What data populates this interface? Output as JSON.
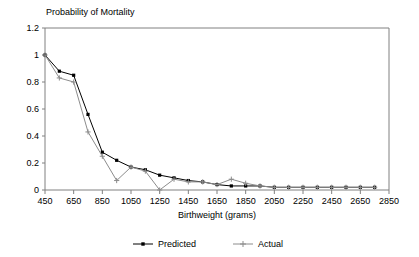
{
  "chart_data": {
    "type": "line",
    "title": "Probability of Mortality",
    "xlabel": "Birthweight (grams)",
    "ylabel": "",
    "xlim": [
      450,
      2850
    ],
    "ylim": [
      0,
      1.2
    ],
    "grid": false,
    "legend_position": "bottom",
    "x_ticks": [
      "450",
      "650",
      "850",
      "1050",
      "1250",
      "1450",
      "1650",
      "1850",
      "2050",
      "2250",
      "2450",
      "2650",
      "2850"
    ],
    "x_tick_values": [
      450,
      650,
      850,
      1050,
      1250,
      1450,
      1650,
      1850,
      2050,
      2250,
      2450,
      2650,
      2850
    ],
    "y_ticks": [
      "0",
      "0.2",
      "0.4",
      "0.6",
      "0.8",
      "1",
      "1.2"
    ],
    "y_tick_values": [
      0,
      0.2,
      0.4,
      0.6,
      0.8,
      1,
      1.2
    ],
    "x": [
      450,
      550,
      650,
      750,
      850,
      950,
      1050,
      1150,
      1250,
      1350,
      1450,
      1550,
      1650,
      1750,
      1850,
      1950,
      2050,
      2150,
      2250,
      2350,
      2450,
      2550,
      2650,
      2750
    ],
    "series": [
      {
        "name": "Predicted",
        "color": "#000000",
        "marker": "square",
        "values": [
          1.0,
          0.88,
          0.85,
          0.56,
          0.28,
          0.22,
          0.17,
          0.15,
          0.11,
          0.09,
          0.07,
          0.06,
          0.04,
          0.03,
          0.03,
          0.03,
          0.02,
          0.02,
          0.02,
          0.02,
          0.02,
          0.02,
          0.02,
          0.02
        ]
      },
      {
        "name": "Actual",
        "color": "#8c8c8c",
        "marker": "plus",
        "values": [
          1.0,
          0.83,
          0.8,
          0.43,
          0.25,
          0.07,
          0.17,
          0.14,
          0.0,
          0.08,
          0.06,
          0.06,
          0.04,
          0.08,
          0.05,
          0.03,
          0.02,
          0.02,
          0.02,
          0.02,
          0.02,
          0.02,
          0.02,
          0.02
        ]
      }
    ]
  },
  "legend": {
    "items": [
      {
        "label": "Predicted"
      },
      {
        "label": "Actual"
      }
    ]
  },
  "colors": {
    "predicted": "#000000",
    "actual": "#8c8c8c",
    "axis": "#808080",
    "frame": "#808080"
  }
}
